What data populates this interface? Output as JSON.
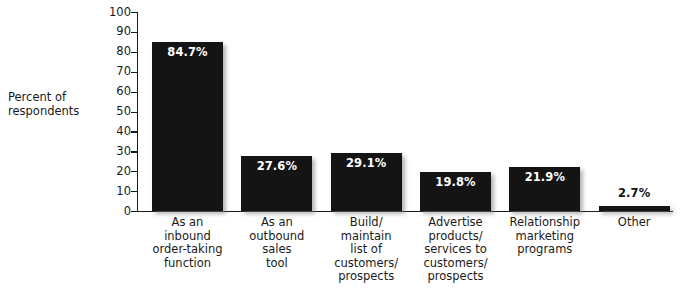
{
  "chart_data": {
    "type": "bar",
    "title": "",
    "xlabel": "",
    "ylabel": "Percent of respondents",
    "ylim": [
      0,
      100
    ],
    "ytick_step": 10,
    "yticks": [
      100,
      90,
      80,
      70,
      60,
      50,
      40,
      30,
      20,
      10,
      0
    ],
    "grid": false,
    "legend": "none",
    "categories": [
      "As an\ninbound\norder-taking\nfunction",
      "As an\noutbound\nsales\ntool",
      "Build/\nmaintain\nlist of\ncustomers/\nprospects",
      "Advertise\nproducts/\nservices to\ncustomers/\nprospects",
      "Relationship\nmarketing\nprograms",
      "Other"
    ],
    "values": [
      84.7,
      27.6,
      29.1,
      19.8,
      21.9,
      2.7
    ],
    "value_labels": [
      "84.7%",
      "27.6%",
      "29.1%",
      "19.8%",
      "21.9%",
      "2.7%"
    ],
    "bar_color": "#141414",
    "label_color_inside": "#FFFFFF",
    "label_color_above": "#111111"
  },
  "title_sliver": "",
  "axis": {
    "y_title_line1": "Percent of",
    "y_title_line2": "respondents"
  },
  "categories_lines": [
    [
      "As an",
      "inbound",
      "order-taking",
      "function"
    ],
    [
      "As an",
      "outbound",
      "sales",
      "tool"
    ],
    [
      "Build/",
      "maintain",
      "list of",
      "customers/",
      "prospects"
    ],
    [
      "Advertise",
      "products/",
      "services to",
      "customers/",
      "prospects"
    ],
    [
      "Relationship",
      "marketing",
      "programs"
    ],
    [
      "Other"
    ]
  ]
}
